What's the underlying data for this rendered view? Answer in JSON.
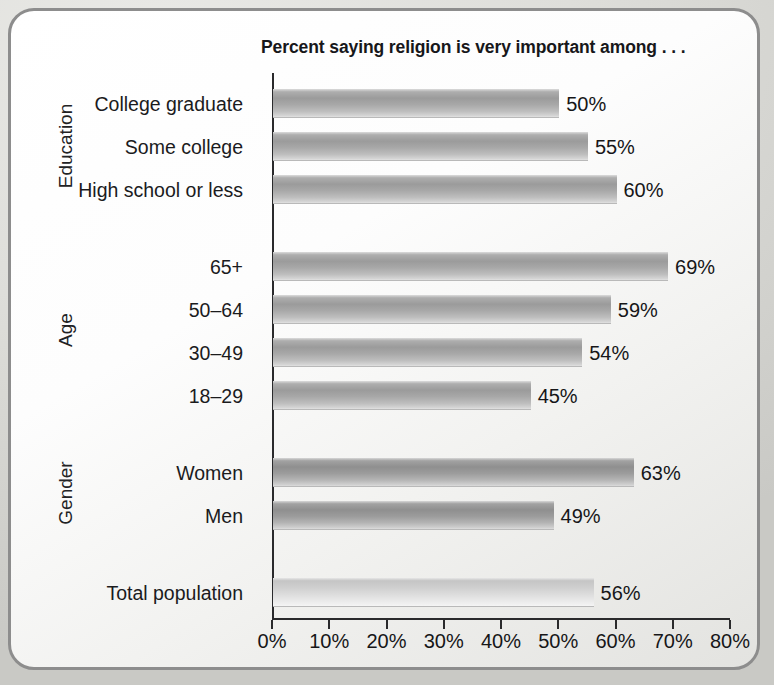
{
  "chart_data": {
    "type": "bar",
    "orientation": "horizontal",
    "title": "Percent saying religion is very important among . . .",
    "xlabel": "",
    "ylabel": "",
    "xlim": [
      0,
      80
    ],
    "grid": false,
    "legend": null,
    "xtick_labels": [
      "0%",
      "10%",
      "20%",
      "30%",
      "40%",
      "50%",
      "60%",
      "70%",
      "80%"
    ],
    "xtick_values": [
      0,
      10,
      20,
      30,
      40,
      50,
      60,
      70,
      80
    ],
    "value_suffix": "%",
    "groups": [
      {
        "name": "Education",
        "label": "Education",
        "categories": [
          "College graduate",
          "Some college",
          "High school or less"
        ],
        "values": [
          50,
          55,
          60
        ],
        "value_labels": [
          "50%",
          "55%",
          "60%"
        ]
      },
      {
        "name": "Age",
        "label": "Age",
        "categories": [
          "65+",
          "50–64",
          "30–49",
          "18–29"
        ],
        "values": [
          69,
          59,
          54,
          45
        ],
        "value_labels": [
          "69%",
          "59%",
          "54%",
          "45%"
        ]
      },
      {
        "name": "Gender",
        "label": "Gender",
        "categories": [
          "Women",
          "Men"
        ],
        "values": [
          63,
          49
        ],
        "value_labels": [
          "63%",
          "49%"
        ]
      },
      {
        "name": "Total",
        "label": "",
        "categories": [
          "Total population"
        ],
        "values": [
          56
        ],
        "value_labels": [
          "56%"
        ]
      }
    ],
    "categories": [
      "College graduate",
      "Some college",
      "High school or less",
      "65+",
      "50–64",
      "30–49",
      "18–29",
      "Women",
      "Men",
      "Total population"
    ],
    "values": [
      50,
      55,
      60,
      69,
      59,
      54,
      45,
      63,
      49,
      56
    ],
    "colors": {
      "bar_mid": "#9b9b9b",
      "bar_dark": "#8f8f8f",
      "bar_light": "#cfcfcf",
      "axis": "#2a2a2c",
      "text": "#161618",
      "frame_border": "#8d8d8d"
    }
  }
}
